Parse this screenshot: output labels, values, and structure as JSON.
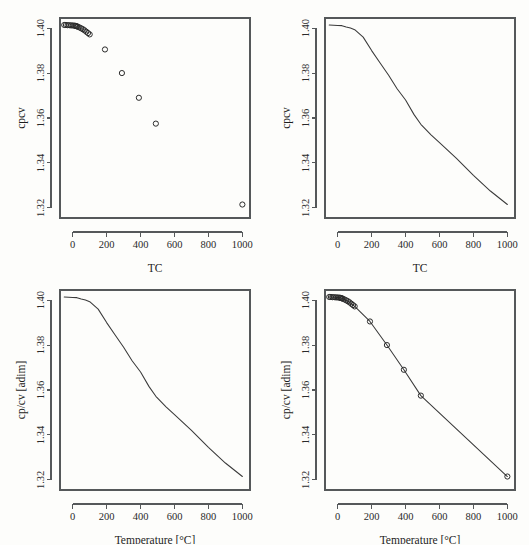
{
  "figure": {
    "name": "cp-cv-ratio-temperature-figure",
    "panel_count": 4,
    "background_color": "#fdfdfb",
    "line_color": "#3a3a3a",
    "marker_color": "#2b2b2b",
    "axis_color": "#55585a"
  },
  "axis_titles": {
    "x_short": "TC",
    "y_short": "cpcv",
    "x_long": "Temperature [°C]",
    "y_long": "cp/cv [adim]"
  },
  "ticks": {
    "x_labels": [
      "0",
      "200",
      "400",
      "600",
      "800",
      "1000"
    ],
    "x_values": [
      0,
      200,
      400,
      600,
      800,
      1000
    ],
    "y_labels": [
      "1.32",
      "1.34",
      "1.36",
      "1.38",
      "1.40"
    ],
    "y_values": [
      1.32,
      1.34,
      1.36,
      1.38,
      1.4
    ]
  },
  "chart_data": [
    {
      "id": "panel-top-left",
      "type": "scatter",
      "title": "",
      "xlabel": "TC",
      "ylabel": "cpcv",
      "xlim": [
        -75,
        1045
      ],
      "ylim": [
        1.3155,
        1.4045
      ],
      "grid": false,
      "legend": "none",
      "marker": "open-circle",
      "x": [
        -50,
        -40,
        -30,
        -20,
        -10,
        0,
        10,
        15,
        20,
        25,
        30,
        40,
        50,
        60,
        70,
        80,
        90,
        100,
        190,
        290,
        390,
        490,
        1000
      ],
      "y": [
        1.4014,
        1.4014,
        1.4013,
        1.4013,
        1.4012,
        1.4012,
        1.4011,
        1.401,
        1.4009,
        1.4008,
        1.4006,
        1.4003,
        1.3999,
        1.3995,
        1.399,
        1.3984,
        1.3978,
        1.3972,
        1.3905,
        1.38,
        1.369,
        1.3575,
        1.3215
      ]
    },
    {
      "id": "panel-top-right",
      "type": "line",
      "title": "",
      "xlabel": "TC",
      "ylabel": "cpcv",
      "xlim": [
        -75,
        1045
      ],
      "ylim": [
        1.3155,
        1.4045
      ],
      "grid": false,
      "legend": "none",
      "x": [
        -50,
        -25,
        0,
        25,
        50,
        75,
        100,
        150,
        200,
        250,
        300,
        350,
        400,
        450,
        490,
        550,
        600,
        700,
        800,
        900,
        1000
      ],
      "y": [
        1.4014,
        1.4013,
        1.4012,
        1.4011,
        1.4005,
        1.4,
        1.3993,
        1.396,
        1.39,
        1.3845,
        1.379,
        1.373,
        1.368,
        1.3615,
        1.3572,
        1.3525,
        1.349,
        1.342,
        1.3345,
        1.3275,
        1.3215
      ]
    },
    {
      "id": "panel-bottom-left",
      "type": "line",
      "title": "",
      "xlabel": "Temperature [°C]",
      "ylabel": "cp/cv [adim]",
      "xlim": [
        -75,
        1045
      ],
      "ylim": [
        1.3155,
        1.4045
      ],
      "grid": false,
      "legend": "none",
      "x": [
        -50,
        -25,
        0,
        25,
        50,
        75,
        100,
        150,
        200,
        250,
        300,
        350,
        400,
        450,
        490,
        550,
        600,
        700,
        800,
        900,
        1000
      ],
      "y": [
        1.4014,
        1.4013,
        1.4012,
        1.4011,
        1.4005,
        1.4,
        1.3993,
        1.396,
        1.39,
        1.3845,
        1.379,
        1.373,
        1.368,
        1.3615,
        1.3572,
        1.3525,
        1.349,
        1.342,
        1.3345,
        1.3275,
        1.3215
      ]
    },
    {
      "id": "panel-bottom-right",
      "type": "line",
      "title": "",
      "xlabel": "Temperature [°C]",
      "ylabel": "cp/cv [adim]",
      "xlim": [
        -75,
        1045
      ],
      "ylim": [
        1.3155,
        1.4045
      ],
      "grid": false,
      "legend": "none",
      "marker": "open-circle",
      "show_markers": true,
      "x": [
        -50,
        -40,
        -30,
        -20,
        -10,
        0,
        10,
        15,
        20,
        25,
        30,
        40,
        50,
        60,
        70,
        80,
        90,
        100,
        190,
        290,
        390,
        490,
        1000
      ],
      "y": [
        1.4014,
        1.4014,
        1.4013,
        1.4013,
        1.4012,
        1.4012,
        1.4011,
        1.401,
        1.4009,
        1.4008,
        1.4006,
        1.4003,
        1.3999,
        1.3995,
        1.399,
        1.3984,
        1.3978,
        1.3972,
        1.3905,
        1.38,
        1.369,
        1.3575,
        1.3215
      ]
    }
  ]
}
